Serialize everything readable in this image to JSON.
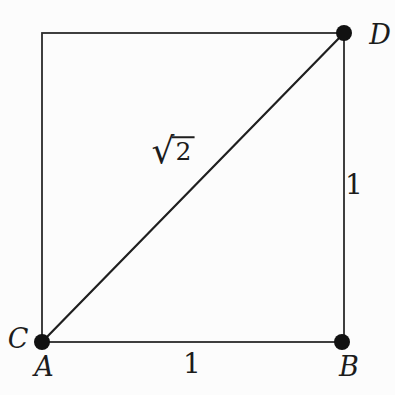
{
  "figure": {
    "type": "geometry-diagram",
    "background_color": "#fcfcfc",
    "line_color": "#2b2b2b",
    "dot_color": "#111111",
    "text_color": "#1c1c1c"
  },
  "labels": {
    "vertex_a": "A",
    "vertex_b": "B",
    "vertex_c": "C",
    "vertex_d": "D",
    "side_bottom_length": "1",
    "side_right_length": "1",
    "diagonal_radical": "√",
    "diagonal_radicand": "2",
    "diagonal_value": "√2"
  }
}
